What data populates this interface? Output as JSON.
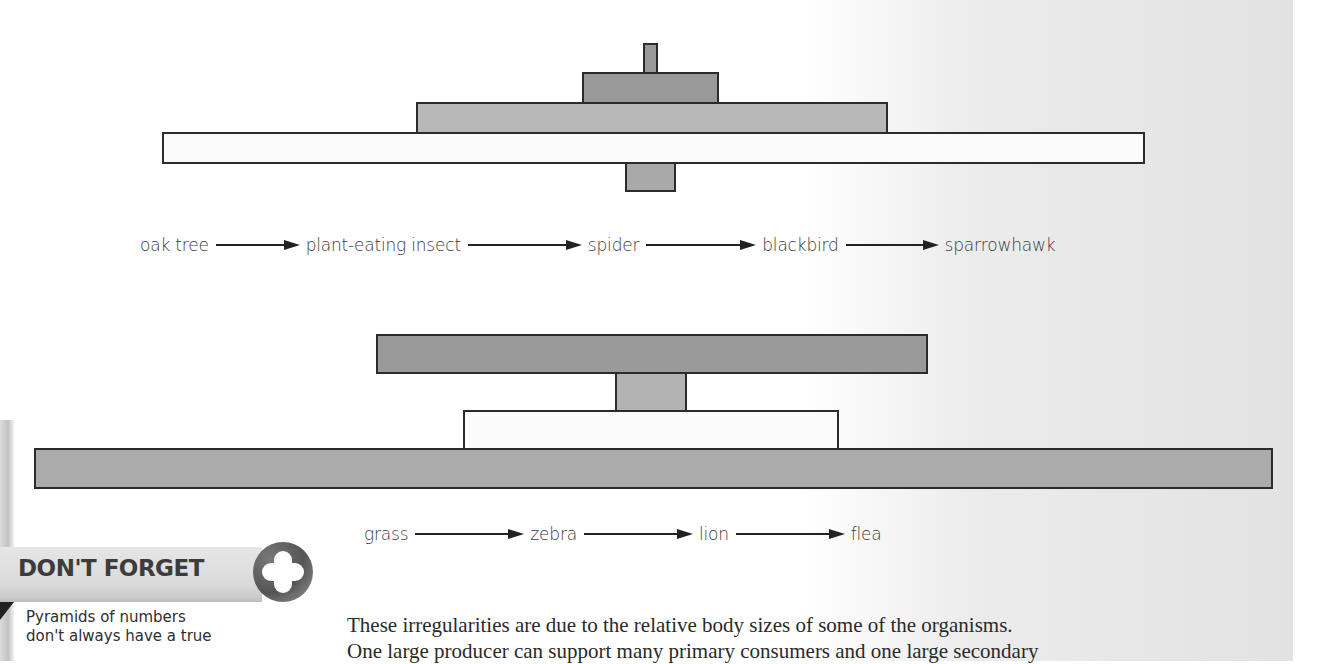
{
  "colors": {
    "white_bar": "#fbfbfb",
    "light_gray_bar": "#b4b4b4",
    "mid_gray_bar": "#a6a6a6",
    "dark_gray_bar": "#8e8e8e",
    "outline": "#2b2b2b"
  },
  "pyramid_1": {
    "description": "Pyramid of numbers for oak tree food chain",
    "levels": [
      {
        "organism": "oak tree",
        "trophic_level": "producer",
        "fill": "white"
      },
      {
        "organism": "plant-eating insect",
        "trophic_level": "primary consumer",
        "fill": "light gray"
      },
      {
        "organism": "spider",
        "trophic_level": "secondary consumer",
        "fill": "mid gray"
      },
      {
        "organism": "blackbird",
        "trophic_level": "tertiary consumer",
        "fill": "dark gray"
      },
      {
        "organism": "sparrowhawk",
        "trophic_level": "quaternary consumer",
        "fill": "gray"
      }
    ]
  },
  "chain_1": {
    "items": [
      "oak tree",
      "plant-eating insect",
      "spider",
      "blackbird",
      "sparrowhawk"
    ]
  },
  "pyramid_2": {
    "description": "Pyramid of numbers for grassland food chain",
    "levels": [
      {
        "organism": "grass",
        "trophic_level": "producer",
        "fill": "gray"
      },
      {
        "organism": "zebra",
        "trophic_level": "primary consumer",
        "fill": "white"
      },
      {
        "organism": "lion",
        "trophic_level": "secondary consumer",
        "fill": "gray"
      },
      {
        "organism": "flea",
        "trophic_level": "parasite",
        "fill": "dark gray"
      }
    ]
  },
  "chain_2": {
    "items": [
      "grass",
      "zebra",
      "lion",
      "flea"
    ]
  },
  "dont_forget": {
    "title": "DON'T FORGET",
    "icon": "plus-icon",
    "lines": [
      "Pyramids of numbers",
      "don't always have a true"
    ]
  },
  "body": {
    "lines": [
      "These irregularities are due to the relative body sizes of some of the organisms.",
      "One large producer can support many primary consumers and one large secondary"
    ]
  }
}
